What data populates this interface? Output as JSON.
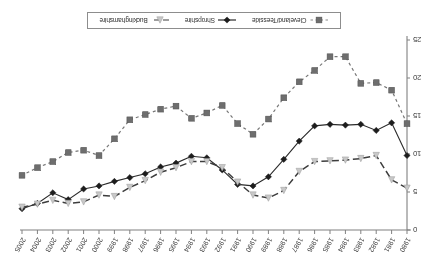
{
  "chart_data": {
    "type": "line",
    "title": "",
    "subtitle": "",
    "xlabel": "",
    "ylabel": "",
    "xlim": [
      1980,
      2005
    ],
    "ylim": [
      0,
      25
    ],
    "grid": false,
    "legend_position": "bottom",
    "x": [
      1980,
      1981,
      1982,
      1983,
      1984,
      1985,
      1986,
      1987,
      1988,
      1989,
      1990,
      1991,
      1992,
      1993,
      1994,
      1995,
      1996,
      1997,
      1998,
      1999,
      2000,
      2001,
      2002,
      2003,
      2004,
      2005
    ],
    "xtick_labels": [
      "1980",
      "1981",
      "1982",
      "1983",
      "1984",
      "1985",
      "1986",
      "1987",
      "1988",
      "1989",
      "1990",
      "1991",
      "1992",
      "1993",
      "1994",
      "1995",
      "1996",
      "1997",
      "1998",
      "1999",
      "2000",
      "2001",
      "2002",
      "2003",
      "2004",
      "2005"
    ],
    "ytick_labels": [
      "0",
      "5",
      "10",
      "15",
      "20",
      "25"
    ],
    "ytick_values": [
      0,
      5,
      10,
      15,
      20,
      25
    ],
    "series": [
      {
        "name": "Cleveland/Teesside",
        "marker": "square",
        "color": "#6e6e6e",
        "line_style": "dotted",
        "values": [
          14.0,
          18.4,
          19.4,
          19.3,
          22.8,
          22.8,
          21.0,
          19.5,
          17.4,
          14.6,
          12.6,
          14.0,
          16.4,
          15.4,
          14.7,
          16.3,
          15.9,
          15.2,
          14.5,
          12.0,
          9.8,
          10.5,
          10.2,
          9.0,
          8.2,
          7.2
        ]
      },
      {
        "name": "Shropshire",
        "marker": "diamond",
        "color": "#1d1d1d",
        "line_style": "solid",
        "values": [
          9.8,
          14.1,
          13.1,
          13.9,
          13.8,
          13.9,
          13.7,
          11.7,
          9.3,
          7.0,
          5.8,
          6.0,
          7.9,
          9.5,
          9.7,
          8.8,
          8.3,
          7.4,
          6.9,
          6.4,
          5.8,
          5.4,
          4.0,
          4.9,
          3.5,
          2.8
        ]
      },
      {
        "name": "Buckinghamshire",
        "marker": "triangle",
        "color": "#c8c8c8",
        "line_style": "dashed",
        "values": [
          5.5,
          6.6,
          9.8,
          9.4,
          9.2,
          9.1,
          9.0,
          7.7,
          5.2,
          4.2,
          4.6,
          6.3,
          8.2,
          9.0,
          9.0,
          8.2,
          7.6,
          6.5,
          5.6,
          4.4,
          4.6,
          3.7,
          3.5,
          3.9,
          3.4,
          3.0
        ]
      }
    ]
  },
  "legend": {
    "items": [
      {
        "label": "Cleveland/Teesside"
      },
      {
        "label": "Shropshire"
      },
      {
        "label": "Buckinghamshire"
      }
    ]
  },
  "axes": {
    "x_axis_name": "year-axis",
    "y_axis_name": "rate-axis"
  }
}
